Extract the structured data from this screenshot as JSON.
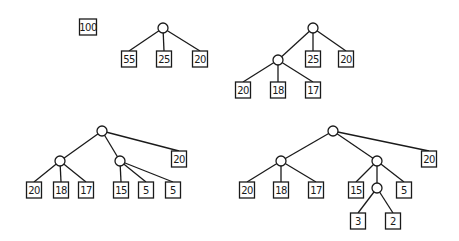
{
  "trees": [
    {
      "id": "t1",
      "nodes": [
        {
          "id": "a",
          "type": "leaf",
          "label": "100",
          "x": 88,
          "y": 27,
          "w": 17
        }
      ],
      "edges": []
    },
    {
      "id": "t2",
      "nodes": [
        {
          "id": "r",
          "type": "internal",
          "x": 163,
          "y": 28
        },
        {
          "id": "l1",
          "type": "leaf",
          "label": "55",
          "x": 129,
          "y": 59
        },
        {
          "id": "l2",
          "type": "leaf",
          "label": "25",
          "x": 164,
          "y": 59
        },
        {
          "id": "l3",
          "type": "leaf",
          "label": "20",
          "x": 200,
          "y": 59
        }
      ],
      "edges": [
        [
          "r",
          "l1"
        ],
        [
          "r",
          "l2"
        ],
        [
          "r",
          "l3"
        ]
      ]
    },
    {
      "id": "t3",
      "nodes": [
        {
          "id": "r",
          "type": "internal",
          "x": 313,
          "y": 28
        },
        {
          "id": "c",
          "type": "internal",
          "x": 278,
          "y": 60
        },
        {
          "id": "l25",
          "type": "leaf",
          "label": "25",
          "x": 313,
          "y": 59
        },
        {
          "id": "l20a",
          "type": "leaf",
          "label": "20",
          "x": 346,
          "y": 59
        },
        {
          "id": "l20b",
          "type": "leaf",
          "label": "20",
          "x": 243,
          "y": 90
        },
        {
          "id": "l18",
          "type": "leaf",
          "label": "18",
          "x": 278,
          "y": 90
        },
        {
          "id": "l17",
          "type": "leaf",
          "label": "17",
          "x": 313,
          "y": 90
        }
      ],
      "edges": [
        [
          "r",
          "c"
        ],
        [
          "r",
          "l25"
        ],
        [
          "r",
          "l20a"
        ],
        [
          "c",
          "l20b"
        ],
        [
          "c",
          "l18"
        ],
        [
          "c",
          "l17"
        ]
      ]
    },
    {
      "id": "t4",
      "nodes": [
        {
          "id": "r",
          "type": "internal",
          "x": 102,
          "y": 131
        },
        {
          "id": "cl",
          "type": "internal",
          "x": 60,
          "y": 161
        },
        {
          "id": "cr",
          "type": "internal",
          "x": 120,
          "y": 161
        },
        {
          "id": "l20a",
          "type": "leaf",
          "label": "20",
          "x": 179,
          "y": 159
        },
        {
          "id": "l20b",
          "type": "leaf",
          "label": "20",
          "x": 34,
          "y": 190
        },
        {
          "id": "l18",
          "type": "leaf",
          "label": "18",
          "x": 61,
          "y": 190
        },
        {
          "id": "l17",
          "type": "leaf",
          "label": "17",
          "x": 86,
          "y": 190
        },
        {
          "id": "l15",
          "type": "leaf",
          "label": "15",
          "x": 121,
          "y": 190
        },
        {
          "id": "l5a",
          "type": "leaf",
          "label": "5",
          "x": 146,
          "y": 190
        },
        {
          "id": "l5b",
          "type": "leaf",
          "label": "5",
          "x": 173,
          "y": 190
        }
      ],
      "edges": [
        [
          "r",
          "cl"
        ],
        [
          "r",
          "cr"
        ],
        [
          "r",
          "l20a"
        ],
        [
          "cl",
          "l20b"
        ],
        [
          "cl",
          "l18"
        ],
        [
          "cl",
          "l17"
        ],
        [
          "cr",
          "l15"
        ],
        [
          "cr",
          "l5a"
        ],
        [
          "cr",
          "l5b"
        ]
      ]
    },
    {
      "id": "t5",
      "nodes": [
        {
          "id": "r",
          "type": "internal",
          "x": 333,
          "y": 131
        },
        {
          "id": "cl",
          "type": "internal",
          "x": 281,
          "y": 161
        },
        {
          "id": "cr",
          "type": "internal",
          "x": 377,
          "y": 161
        },
        {
          "id": "cc",
          "type": "internal",
          "x": 377,
          "y": 188
        },
        {
          "id": "l20a",
          "type": "leaf",
          "label": "20",
          "x": 429,
          "y": 159
        },
        {
          "id": "l20b",
          "type": "leaf",
          "label": "20",
          "x": 247,
          "y": 190
        },
        {
          "id": "l18",
          "type": "leaf",
          "label": "18",
          "x": 281,
          "y": 190
        },
        {
          "id": "l17",
          "type": "leaf",
          "label": "17",
          "x": 316,
          "y": 190
        },
        {
          "id": "l15",
          "type": "leaf",
          "label": "15",
          "x": 356,
          "y": 190
        },
        {
          "id": "l5",
          "type": "leaf",
          "label": "5",
          "x": 404,
          "y": 190
        },
        {
          "id": "l3",
          "type": "leaf",
          "label": "3",
          "x": 358,
          "y": 221
        },
        {
          "id": "l2",
          "type": "leaf",
          "label": "2",
          "x": 393,
          "y": 221
        }
      ],
      "edges": [
        [
          "r",
          "cl"
        ],
        [
          "r",
          "cr"
        ],
        [
          "r",
          "l20a"
        ],
        [
          "cl",
          "l20b"
        ],
        [
          "cl",
          "l18"
        ],
        [
          "cl",
          "l17"
        ],
        [
          "cr",
          "l15"
        ],
        [
          "cr",
          "cc"
        ],
        [
          "cr",
          "l5"
        ],
        [
          "cc",
          "l3"
        ],
        [
          "cc",
          "l2"
        ]
      ]
    }
  ]
}
